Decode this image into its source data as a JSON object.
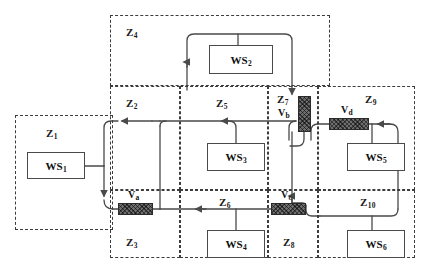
{
  "diagram": {
    "colors": {
      "zone_border": "#3c3c3c",
      "line": "#4a4a4a",
      "valve_fill": "#6e6e6e",
      "box_border": "#4a4a4a",
      "background": "#ffffff"
    },
    "zones": [
      {
        "id": "Z1",
        "base": "Z",
        "sub": "1",
        "label": "Z1",
        "x": 15,
        "y": 115,
        "w": 98,
        "h": 115,
        "label_x": 46,
        "label_y": 127
      },
      {
        "id": "Z2",
        "base": "Z",
        "sub": "2",
        "label": "Z2",
        "x": 110,
        "y": 86,
        "w": 70,
        "h": 104,
        "label_x": 126,
        "label_y": 97
      },
      {
        "id": "Z3",
        "base": "Z",
        "sub": "3",
        "label": "Z3",
        "x": 110,
        "y": 190,
        "w": 70,
        "h": 68,
        "label_x": 126,
        "label_y": 236
      },
      {
        "id": "Z4",
        "base": "Z",
        "sub": "4",
        "label": "Z4",
        "x": 110,
        "y": 15,
        "w": 220,
        "h": 71,
        "label_x": 126,
        "label_y": 26
      },
      {
        "id": "Z5",
        "base": "Z",
        "sub": "5",
        "label": "Z5",
        "x": 180,
        "y": 86,
        "w": 88,
        "h": 104,
        "label_x": 216,
        "label_y": 97
      },
      {
        "id": "Z6",
        "base": "Z",
        "sub": "6",
        "label": "Z6",
        "x": 180,
        "y": 190,
        "w": 88,
        "h": 68,
        "label_x": 219,
        "label_y": 196
      },
      {
        "id": "Z7",
        "base": "Z",
        "sub": "7",
        "label": "Z7",
        "x": 268,
        "y": 86,
        "w": 50,
        "h": 104,
        "label_x": 277,
        "label_y": 95
      },
      {
        "id": "Z8",
        "base": "Z",
        "sub": "8",
        "label": "Z8",
        "x": 268,
        "y": 190,
        "w": 50,
        "h": 68,
        "label_x": 283,
        "label_y": 236
      },
      {
        "id": "Z9",
        "base": "Z",
        "sub": "9",
        "label": "Z9",
        "x": 318,
        "y": 86,
        "w": 97,
        "h": 104,
        "label_x": 365,
        "label_y": 95
      },
      {
        "id": "Z10",
        "base": "Z",
        "sub": "10",
        "label": "Z10",
        "x": 318,
        "y": 190,
        "w": 97,
        "h": 68,
        "label_x": 362,
        "label_y": 196
      }
    ],
    "workstations": [
      {
        "id": "WS1",
        "base": "WS",
        "sub": "1",
        "label": "WS1",
        "x": 27,
        "y": 152,
        "w": 58,
        "h": 27,
        "zone": "Z1"
      },
      {
        "id": "WS2",
        "base": "WS",
        "sub": "2",
        "label": "WS2",
        "x": 209,
        "y": 45,
        "w": 64,
        "h": 29,
        "zone": "Z4"
      },
      {
        "id": "WS3",
        "base": "WS",
        "sub": "3",
        "label": "WS3",
        "x": 207,
        "y": 143,
        "w": 58,
        "h": 28,
        "zone": "Z5"
      },
      {
        "id": "WS4",
        "base": "WS",
        "sub": "4",
        "label": "WS4",
        "x": 207,
        "y": 230,
        "w": 58,
        "h": 28,
        "zone": "Z6"
      },
      {
        "id": "WS5",
        "base": "WS",
        "sub": "5",
        "label": "WS5",
        "x": 347,
        "y": 143,
        "w": 58,
        "h": 28,
        "zone": "Z9"
      },
      {
        "id": "WS6",
        "base": "WS",
        "sub": "6",
        "label": "WS6",
        "x": 347,
        "y": 230,
        "w": 58,
        "h": 28,
        "zone": "Z10"
      }
    ],
    "valves": [
      {
        "id": "Va",
        "base": "V",
        "sub": "a",
        "label": "Va",
        "orientation": "horizontal",
        "x": 118,
        "y": 203,
        "w": 35,
        "h": 12,
        "label_x": 128,
        "label_y": 190
      },
      {
        "id": "Vb",
        "base": "V",
        "sub": "b",
        "label": "Vb",
        "orientation": "vertical",
        "x": 298,
        "y": 96,
        "w": 13,
        "h": 36,
        "label_x": 279,
        "label_y": 108
      },
      {
        "id": "Vc",
        "base": "V",
        "sub": "c",
        "label": "Vc",
        "orientation": "horizontal",
        "x": 271,
        "y": 203,
        "w": 35,
        "h": 12,
        "label_x": 281,
        "label_y": 190
      },
      {
        "id": "Vd",
        "base": "V",
        "sub": "d",
        "label": "Vd",
        "orientation": "horizontal",
        "x": 329,
        "y": 118,
        "w": 40,
        "h": 12,
        "label_x": 341,
        "label_y": 105
      }
    ]
  }
}
